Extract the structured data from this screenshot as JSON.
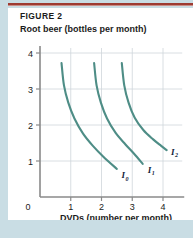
{
  "figure": {
    "label": "FIGURE 2"
  },
  "axes": {
    "y_title": "Root beer (bottles per month)",
    "x_title": "DVDs (number per month)",
    "origin_label": "0"
  },
  "colors": {
    "curve": "#4e8d86",
    "rule": "#9e3b32",
    "page_background": "#c9dde4",
    "panel_background": "#ffffff",
    "grid": "#cfd6da",
    "axis": "#8a8a8a",
    "text": "#1b1b1b",
    "curve_label": "#12243a"
  },
  "chart_data": {
    "type": "line",
    "title": "FIGURE 2",
    "xlabel": "DVDs (number per month)",
    "ylabel": "Root beer (bottles per month)",
    "xlim": [
      0,
      4.5
    ],
    "ylim": [
      0,
      4.4
    ],
    "xticks": [
      1,
      2,
      3,
      4
    ],
    "yticks": [
      1,
      2,
      3,
      4
    ],
    "xtick_labels": [
      "1",
      "2",
      "3",
      "4"
    ],
    "ytick_labels": [
      "1",
      "2",
      "3",
      "4"
    ],
    "grid": true,
    "legend": "inline-curve-labels",
    "series": [
      {
        "name": "I0",
        "label": "I",
        "subscript": "0",
        "label_x": 2.65,
        "label_y": 0.52,
        "points": [
          [
            0.7,
            3.72
          ],
          [
            0.78,
            3.1
          ],
          [
            0.92,
            2.62
          ],
          [
            1.12,
            2.18
          ],
          [
            1.4,
            1.76
          ],
          [
            1.72,
            1.42
          ],
          [
            2.06,
            1.12
          ],
          [
            2.5,
            0.78
          ]
        ]
      },
      {
        "name": "I1",
        "label": "I",
        "subscript": "1",
        "label_x": 3.5,
        "label_y": 0.68,
        "points": [
          [
            1.76,
            3.72
          ],
          [
            1.84,
            3.1
          ],
          [
            1.98,
            2.62
          ],
          [
            2.18,
            2.18
          ],
          [
            2.46,
            1.78
          ],
          [
            2.78,
            1.46
          ],
          [
            3.06,
            1.2
          ],
          [
            3.34,
            0.92
          ]
        ]
      },
      {
        "name": "I2",
        "label": "I",
        "subscript": "2",
        "label_x": 4.26,
        "label_y": 1.18,
        "points": [
          [
            2.66,
            3.72
          ],
          [
            2.74,
            3.1
          ],
          [
            2.88,
            2.62
          ],
          [
            3.08,
            2.2
          ],
          [
            3.36,
            1.86
          ],
          [
            3.68,
            1.6
          ],
          [
            3.94,
            1.42
          ],
          [
            4.12,
            1.3
          ]
        ]
      }
    ]
  }
}
